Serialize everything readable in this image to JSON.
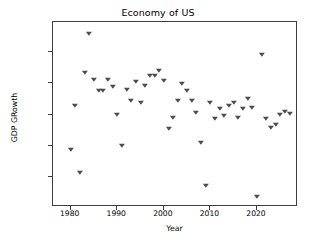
{
  "chart_data": {
    "type": "scatter",
    "title": "Economy of US",
    "xlabel": "Year",
    "ylabel": "GDP GRowth",
    "xlim": [
      1976.2,
      1978.8
    ],
    "x_axis_range": [
      1976.2,
      2028.8
    ],
    "ylim": [
      -0.0395,
      0.0795
    ],
    "grid": false,
    "legend": null,
    "marker": "triangle-down",
    "marker_color": "#4c4c4c",
    "x_ticks": [
      1980,
      1990,
      2000,
      2010,
      2020
    ],
    "x_tick_labels": [
      "1980",
      "1990",
      "2000",
      "2010",
      "2020"
    ],
    "y_ticks": [
      -0.02,
      0.0,
      0.02,
      0.04,
      0.06
    ],
    "y_tick_labels": [
      "−0.02",
      "0.00",
      "0.02",
      "0.04",
      "0.06"
    ],
    "x": [
      1980,
      1981,
      1982,
      1983,
      1984,
      1985,
      1986,
      1987,
      1988,
      1989,
      1990,
      1991,
      1992,
      1993,
      1994,
      1995,
      1996,
      1997,
      1998,
      1999,
      2000,
      2001,
      2002,
      2003,
      2004,
      2005,
      2006,
      2007,
      2008,
      2009,
      2010,
      2011,
      2012,
      2013,
      2014,
      2015,
      2016,
      2017,
      2018,
      2019,
      2020,
      2021,
      2022,
      2023,
      2024,
      2025,
      2026,
      2027
    ],
    "y": [
      -0.0028,
      0.0252,
      -0.0177,
      0.0465,
      0.0719,
      0.0423,
      0.0354,
      0.0354,
      0.0424,
      0.0375,
      0.0196,
      -0.0002,
      0.0357,
      0.0287,
      0.0406,
      0.0275,
      0.0386,
      0.0445,
      0.0449,
      0.048,
      0.0414,
      0.0107,
      0.0179,
      0.0288,
      0.0397,
      0.0353,
      0.0287,
      0.0207,
      0.0018,
      -0.0258,
      0.0277,
      0.017,
      0.0238,
      0.0188,
      0.0257,
      0.0277,
      0.0179,
      0.0238,
      0.0297,
      0.0242,
      -0.0332,
      0.0583,
      0.017,
      0.011,
      0.0132,
      0.0198,
      0.0213,
      0.0202
    ],
    "series_name": "GDP Growth"
  },
  "figure": {
    "background": "#ffffff",
    "axes_color": "#3d3d3d"
  }
}
